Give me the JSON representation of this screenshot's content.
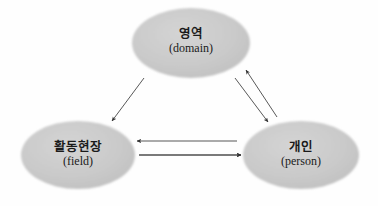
{
  "diagram": {
    "title": "",
    "background_color": "#fefefe",
    "node_fill_color": "#c9c9c9",
    "node_edge_color": "#bdbdbd",
    "arrow_color": "#3a3a3a",
    "text_color": "#1a1a1a",
    "nodes": [
      {
        "id": "domain",
        "label_ko": "영역",
        "label_en": "(domain)",
        "cx": 191,
        "cy": 43,
        "rx": 59,
        "ry": 35
      },
      {
        "id": "field",
        "label_ko": "활동현장",
        "label_en": "(field)",
        "cx": 78,
        "cy": 155,
        "rx": 57,
        "ry": 34
      },
      {
        "id": "person",
        "label_ko": "개인",
        "label_en": "(person)",
        "cx": 301,
        "cy": 155,
        "rx": 58,
        "ry": 34
      }
    ],
    "arrows": [
      {
        "id": "field-to-domain",
        "from": "field",
        "to": "domain",
        "direction": "up-right",
        "x1": 100,
        "y1": 115,
        "x2": 132,
        "y2": 68
      },
      {
        "id": "domain-to-field",
        "from": "domain",
        "to": "field",
        "direction": "down-left",
        "x1": 144,
        "y1": 78,
        "x2": 112,
        "y2": 121
      },
      {
        "id": "person-to-domain",
        "from": "person",
        "to": "domain",
        "direction": "up-left",
        "x1": 277,
        "y1": 117,
        "x2": 246,
        "y2": 70
      },
      {
        "id": "domain-to-person",
        "from": "domain",
        "to": "person",
        "direction": "down-right",
        "x1": 235,
        "y1": 78,
        "x2": 268,
        "y2": 122
      },
      {
        "id": "person-to-field",
        "from": "person",
        "to": "field",
        "direction": "left",
        "x1": 237,
        "y1": 141,
        "x2": 137,
        "y2": 141
      },
      {
        "id": "field-to-person",
        "from": "field",
        "to": "person",
        "direction": "right",
        "x1": 139,
        "y1": 155,
        "x2": 241,
        "y2": 155
      }
    ]
  }
}
